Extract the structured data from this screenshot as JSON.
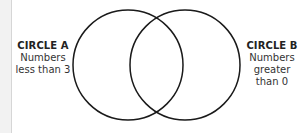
{
  "diagram": {
    "type": "venn",
    "circles": [
      {
        "id": "A",
        "title": "CIRCLE A",
        "desc_lines": [
          "Numbers",
          "less than 3"
        ]
      },
      {
        "id": "B",
        "title": "CIRCLE B",
        "desc_lines": [
          "Numbers",
          "greater",
          "than 0"
        ]
      }
    ],
    "stroke_color": "#1a1a1a"
  }
}
